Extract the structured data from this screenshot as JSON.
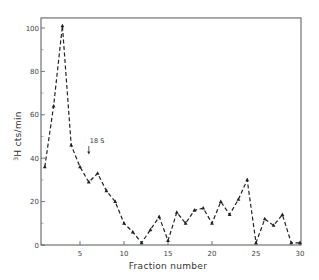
{
  "chart_data": {
    "type": "line",
    "title": "",
    "xlabel": "Fraction number",
    "ylabel_sup": "3",
    "ylabel": "H cts/min",
    "x": [
      1,
      2,
      3,
      4,
      5,
      6,
      7,
      8,
      9,
      10,
      11,
      12,
      13,
      14,
      15,
      16,
      17,
      18,
      19,
      20,
      21,
      22,
      23,
      24,
      25,
      26,
      27,
      28,
      29,
      30
    ],
    "series": [
      {
        "name": "3H cts/min",
        "values": [
          36,
          64,
          101,
          46,
          36,
          29,
          33,
          25,
          20,
          10,
          6,
          1,
          7,
          13,
          2,
          15,
          10,
          16,
          17,
          10,
          20,
          14,
          21,
          30,
          1,
          12,
          9,
          14,
          1,
          1
        ],
        "line_style": "dashed",
        "marker": "triangle",
        "color": "#222222"
      }
    ],
    "xlim": [
      0.5,
      30
    ],
    "ylim": [
      0,
      105
    ],
    "xticks": [
      5,
      10,
      15,
      20,
      25,
      30
    ],
    "xtick_labels": [
      "5",
      "10",
      "15",
      "20",
      "25",
      "30"
    ],
    "yticks": [
      0,
      20,
      40,
      60,
      80,
      100
    ],
    "ytick_labels": [
      "0",
      "20",
      "40",
      "60",
      "80",
      "100"
    ],
    "y_minor_ticks": [
      10,
      30,
      50,
      70,
      90
    ],
    "grid": false,
    "legend": null,
    "annotations": [
      {
        "text": "18 S",
        "x": 6,
        "arrow": "down",
        "y_text": 47
      }
    ]
  }
}
